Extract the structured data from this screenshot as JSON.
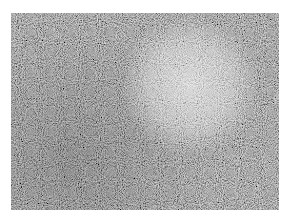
{
  "image": {
    "description": "Grayscale micrograph-like noisy texture with a bright diffuse circular region upper-right of center",
    "colors": {
      "background": "#ffffff",
      "base_gray": "#4a4a4a",
      "highlight": "#d8d8d8"
    },
    "bright_region": {
      "cx": 179,
      "cy": 72,
      "r": 62
    }
  }
}
